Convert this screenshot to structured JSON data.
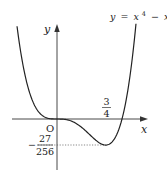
{
  "figure": {
    "equation_label": "y = x⁴ − x³",
    "equation_parts": {
      "lhs": "y",
      "eq": "=",
      "term1_base": "x",
      "term1_exp": "4",
      "minus": "−",
      "term2_base": "x",
      "term2_exp": "3"
    },
    "x_axis_label": "x",
    "y_axis_label": "y",
    "origin_label": "O",
    "x_min_label": {
      "numerator": "3",
      "denominator": "4"
    },
    "y_min_label": {
      "sign": "−",
      "numerator": "27",
      "denominator": "256"
    }
  },
  "chart_data": {
    "type": "line",
    "function": "y = x^4 - x^3",
    "xlabel": "x",
    "ylabel": "y",
    "annotations": [
      {
        "text": "O",
        "x": 0,
        "y": 0
      },
      {
        "text": "3/4",
        "x": 0.75,
        "y": 0,
        "note": "x-coordinate of minimum"
      },
      {
        "text": "-27/256",
        "x": 0,
        "y": -0.10546875,
        "note": "minimum value, dashed guide line"
      }
    ],
    "key_points": [
      {
        "x": 0,
        "y": 0,
        "note": "inflection/stationary point at origin"
      },
      {
        "x": 0.75,
        "y": -0.10546875,
        "note": "local minimum"
      },
      {
        "x": 1,
        "y": 0,
        "note": "x-intercept"
      }
    ],
    "xlim": [
      -0.615,
      1.215
    ],
    "ylim": [
      -0.15,
      0.39
    ],
    "grid": false,
    "legend": "none"
  }
}
